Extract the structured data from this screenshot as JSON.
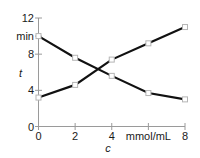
{
  "chart_data": {
    "type": "line",
    "title": "",
    "subtitle": "",
    "xlabel": "c",
    "ylabel": "t",
    "x_unit": "mmol/mL",
    "y_unit": "min",
    "xlim": [
      0,
      8
    ],
    "ylim": [
      0,
      12
    ],
    "xticks": [
      0,
      2,
      4,
      6,
      8
    ],
    "xtick_labels": [
      "0",
      "2",
      "4",
      "mmol/mL",
      "8"
    ],
    "yticks": [
      0,
      4,
      8,
      12
    ],
    "ytick_labels": [
      "0",
      "4",
      "8",
      "12"
    ],
    "y_unit_label": "min",
    "y_unit_label_value": 10,
    "grid": false,
    "legend": "none",
    "marker": "open-square",
    "line_color": "#111111",
    "axis_color": "#9a9a9a",
    "x": [
      0,
      2,
      4,
      6,
      8
    ],
    "series": [
      {
        "name": "descending",
        "values": [
          10.0,
          7.6,
          5.6,
          3.7,
          3.0
        ]
      },
      {
        "name": "ascending",
        "values": [
          3.2,
          4.6,
          7.4,
          9.2,
          11.0
        ]
      }
    ]
  },
  "axes": {
    "y_title": "t",
    "x_title": "c"
  }
}
